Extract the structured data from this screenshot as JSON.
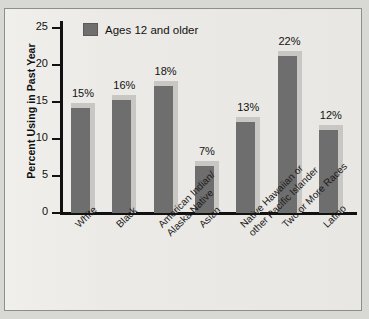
{
  "chart_data": {
    "type": "bar",
    "title": "",
    "xlabel": "",
    "ylabel": "Percent Using in Past Year",
    "ylim": [
      0,
      25
    ],
    "yticks": [
      0,
      5,
      10,
      15,
      20,
      25
    ],
    "ytick_labels": [
      "0",
      "5",
      "10",
      "15",
      "20",
      "25"
    ],
    "grid": false,
    "legend_position": "top-left",
    "legend": [
      "Ages 12 and older"
    ],
    "categories": [
      "White",
      "Black",
      "American Indian/ Alaska Native",
      "Asian",
      "Native Hawaiian or other Pacific Islander",
      "Two or More Races",
      "Latino"
    ],
    "category_lines": [
      [
        "White"
      ],
      [
        "Black"
      ],
      [
        "American Indian/",
        "Alaska Native"
      ],
      [
        "Asian"
      ],
      [
        "Native Hawaiian or",
        "other Pacific Islander"
      ],
      [
        "Two or More Races"
      ],
      [
        "Latino"
      ]
    ],
    "values": [
      15,
      16,
      18,
      7,
      13,
      22,
      12
    ],
    "value_labels": [
      "15%",
      "16%",
      "18%",
      "7%",
      "13%",
      "22%",
      "12%"
    ],
    "series": [
      {
        "name": "Ages 12 and older",
        "values": [
          15,
          16,
          18,
          7,
          13,
          22,
          12
        ]
      }
    ],
    "colors": {
      "bar_face": "#6e6e6e",
      "bar_highlight": "#c9c7c3",
      "axis": "#111111",
      "plot_background": "#eceae6",
      "frame_border": "#8e8e8a",
      "page_background": "#d8d8d4"
    }
  }
}
